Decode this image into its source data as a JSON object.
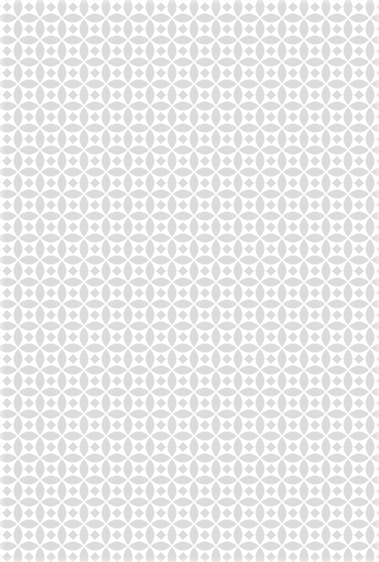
{
  "background": {
    "type": "repeating-geometric-pattern",
    "motif": "quatrefoil-lens-lattice",
    "colors": {
      "base": "#ffffff",
      "shape": "#dcdcdc"
    },
    "tile_size_px": 44
  }
}
